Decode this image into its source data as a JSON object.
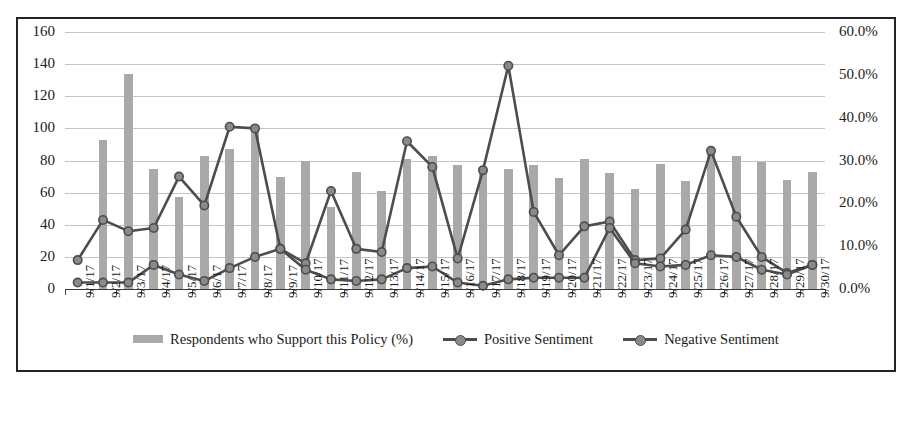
{
  "chart_data": {
    "type": "bar",
    "title": "",
    "subtitle": "",
    "xlabel": "",
    "ylabel": "",
    "y2label": "",
    "grid": true,
    "legend_position": "bottom",
    "ylim": [
      0,
      160
    ],
    "y2lim": [
      0,
      0.6
    ],
    "y_ticks": [
      "0",
      "20",
      "40",
      "60",
      "80",
      "100",
      "120",
      "140",
      "160"
    ],
    "y2_ticks": [
      "0.0%",
      "10.0%",
      "20.0%",
      "30.0%",
      "40.0%",
      "50.0%",
      "60.0%"
    ],
    "categories": [
      "9/1/17",
      "9/2/17",
      "9/3/17",
      "9/4/17",
      "9/5/17",
      "9/6/17",
      "9/7/17",
      "9/8/17",
      "9/9/17",
      "9/10/17",
      "9/11/17",
      "9/12/17",
      "9/13/17",
      "9/14/17",
      "9/15/17",
      "9/16/17",
      "9/17/17",
      "9/18/17",
      "9/19/17",
      "9/20/17",
      "9/21/17",
      "9/22/17",
      "9/23/17",
      "9/24/17",
      "9/25/17",
      "9/26/17",
      "9/27/17",
      "9/28/17",
      "9/29/17",
      "9/30/17"
    ],
    "series": [
      {
        "name": "Respondents who Support this Policy (%)",
        "type": "bar",
        "axis": "left",
        "color": "#a9a9a9",
        "values": [
          0,
          93,
          134,
          75,
          57,
          83,
          87,
          100,
          70,
          80,
          51,
          73,
          61,
          81,
          83,
          77,
          76,
          75,
          77,
          69,
          81,
          72,
          62,
          78,
          67,
          85,
          83,
          79,
          68,
          73
        ]
      },
      {
        "name": "Positive Sentiment",
        "type": "line",
        "axis": "right",
        "color": "#4d4d4d",
        "marker": "circle",
        "values_left_axis": [
          18,
          43,
          36,
          38,
          70,
          52,
          101,
          100,
          25,
          16,
          61,
          25,
          23,
          92,
          76,
          19,
          74,
          139,
          48,
          21,
          39,
          42,
          18,
          19,
          37,
          86,
          45,
          20,
          10,
          15
        ],
        "values_percent": [
          6.8,
          16.1,
          13.5,
          14.3,
          26.3,
          19.5,
          37.9,
          37.5,
          9.4,
          6.0,
          22.9,
          9.4,
          8.6,
          34.5,
          28.5,
          7.1,
          27.8,
          52.1,
          18.0,
          7.9,
          14.6,
          15.8,
          6.8,
          7.1,
          13.9,
          32.3,
          16.9,
          7.5,
          3.8,
          5.6
        ]
      },
      {
        "name": "Negative Sentiment",
        "type": "line",
        "axis": "right",
        "color": "#4d4d4d",
        "marker": "circle",
        "values_left_axis": [
          4,
          4,
          4,
          15,
          9,
          5,
          13,
          20,
          25,
          12,
          6,
          5,
          6,
          13,
          14,
          4,
          2,
          6,
          7,
          7,
          7,
          38,
          16,
          14,
          15,
          21,
          20,
          12,
          9,
          15
        ],
        "values_percent": [
          1.5,
          1.5,
          1.5,
          5.6,
          3.4,
          1.9,
          4.9,
          7.5,
          9.4,
          4.5,
          2.3,
          1.9,
          2.3,
          4.9,
          5.3,
          1.5,
          0.8,
          2.3,
          2.6,
          2.6,
          2.6,
          14.3,
          6.0,
          5.3,
          5.6,
          7.9,
          7.5,
          4.5,
          3.4,
          5.6
        ]
      }
    ]
  },
  "legend": {
    "items": [
      {
        "label": "Respondents who Support this Policy (%)",
        "marker": "bar-swatch"
      },
      {
        "label": "Positive Sentiment",
        "marker": "line-marker-swatch"
      },
      {
        "label": "Negative Sentiment",
        "marker": "line-marker-swatch"
      }
    ]
  },
  "colors": {
    "bar": "#a9a9a9",
    "line": "#4d4d4d",
    "marker_fill": "#8a8a8a",
    "gridline": "#b9b9c6",
    "border": "#232323",
    "text": "#1b1b1b"
  }
}
